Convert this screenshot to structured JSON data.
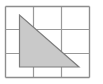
{
  "figure": {
    "canvas": {
      "width": 103,
      "height": 84,
      "background": "#ffffff"
    },
    "grid": {
      "name": "square-grid",
      "rows": 3,
      "columns": 3,
      "line_color": "#9a9a9a",
      "line_width": 1.2,
      "outer_border_color": "#8d8d8d",
      "outer_border_width": 1.4,
      "frame": {
        "left": 5.5,
        "top": 6.5,
        "right": 89.5,
        "bottom": 77.5
      },
      "vertical_lines_x": [
        5.5,
        33.5,
        61.5,
        89.5
      ],
      "horizontal_lines_y": [
        6.5,
        29.5,
        53.5,
        77.5
      ],
      "cell_width": 28,
      "cell_height": 23.67
    },
    "triangle": {
      "name": "shaded-right-triangle",
      "fill_color": "#c9c9c9",
      "stroke_color": "#7d7d7d",
      "stroke_width": 1.2,
      "vertices": [
        {
          "label": "apex",
          "x": 19.5,
          "y": 15
        },
        {
          "label": "bottom-left",
          "x": 19.5,
          "y": 67
        },
        {
          "label": "bottom-right",
          "x": 79,
          "y": 67
        }
      ],
      "points_attr": "19.5,15 19.5,67 79,67",
      "legs": {
        "vertical_height": 52,
        "horizontal_base": 59.5
      },
      "right_angle_at": "bottom-left"
    }
  }
}
